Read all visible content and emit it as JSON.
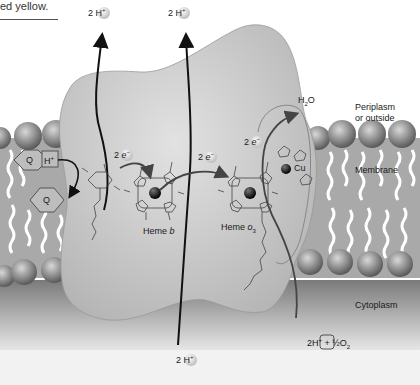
{
  "caption": {
    "text": "ed yellow."
  },
  "labels": {
    "proton_top_left": {
      "coef": "2 H",
      "charge": "+"
    },
    "proton_top_right": {
      "coef": "2 H",
      "charge": "+"
    },
    "proton_bottom": {
      "coef": "2 H",
      "charge": "+"
    },
    "electron_1": {
      "coef": "2",
      "symbol": "e",
      "charge": "−"
    },
    "electron_2": {
      "coef": "2",
      "symbol": "e",
      "charge": "−"
    },
    "electron_3": {
      "coef": "2",
      "symbol": "e",
      "charge": "−"
    },
    "heme_b": {
      "name": "Heme ",
      "suffix": "b"
    },
    "heme_o3": {
      "name": "Heme ",
      "suffix": "o",
      "subscript": "3"
    },
    "copper": "Cu",
    "quinone_upper": "Q",
    "quinone_lower": "Q",
    "quinone_proton": {
      "symbol": "H",
      "charge": "+"
    },
    "water": {
      "h": "H",
      "sub": "2",
      "o": "O"
    },
    "periplasm": {
      "line1": "Periplasm",
      "line2": "or outside"
    },
    "membrane": "Membrane",
    "cytoplasm": "Cytoplasm",
    "reactants": {
      "text": "2H",
      "charge": "+",
      "plus": " + ",
      "half": "½",
      "oxygen": "O",
      "sub": "2"
    }
  },
  "colors": {
    "protein": "#c9c9c9",
    "protein_edge": "#8a8a8a",
    "lipid_head": "#8f8f8f",
    "lipid_core": "#a8a8a8",
    "cytoplasm_bg": "#9a9a9a",
    "arrow": "#111111",
    "arrow_grey": "#555555"
  }
}
